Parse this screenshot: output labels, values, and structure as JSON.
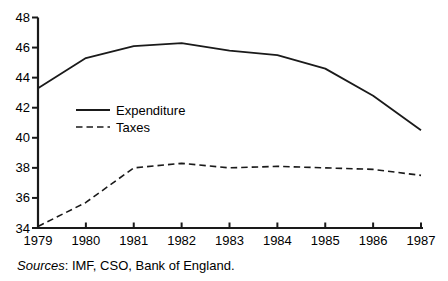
{
  "chart_data": {
    "type": "line",
    "title": "",
    "xlabel": "",
    "ylabel": "",
    "categories": [
      "1979",
      "1980",
      "1981",
      "1982",
      "1983",
      "1984",
      "1985",
      "1986",
      "1987"
    ],
    "series": [
      {
        "name": "Expenditure",
        "line_style": "solid",
        "values": [
          43.3,
          45.3,
          46.1,
          46.3,
          45.8,
          45.5,
          44.6,
          42.8,
          40.5
        ]
      },
      {
        "name": "Taxes",
        "line_style": "dashed",
        "values": [
          34.1,
          35.7,
          38.0,
          38.3,
          38.0,
          38.1,
          38.0,
          37.9,
          37.5
        ]
      }
    ],
    "ylim": [
      34,
      48
    ],
    "y_ticks": [
      48,
      46,
      44,
      42,
      40,
      38,
      36,
      34
    ],
    "grid": false,
    "legend_position": "inside-top-left",
    "colors": {
      "line": "#1a1a1a",
      "text": "#000000",
      "background": "#ffffff"
    }
  },
  "footer": {
    "sources_label": "Sources",
    "sources_text": ": IMF, CSO, Bank of England."
  }
}
